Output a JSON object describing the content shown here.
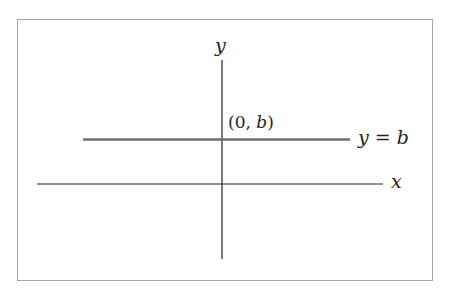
{
  "diagram": {
    "type": "coordinate-plane",
    "labels": {
      "y_axis": "y",
      "x_axis": "x",
      "point_open": "(0,",
      "point_var": "b",
      "point_close": ")",
      "line_lhs": "y",
      "line_eq": "=",
      "line_rhs": "b"
    },
    "elements": [
      {
        "kind": "axis",
        "name": "x-axis",
        "label": "x"
      },
      {
        "kind": "axis",
        "name": "y-axis",
        "label": "y"
      },
      {
        "kind": "horizontal-line",
        "equation": "y = b"
      },
      {
        "kind": "point",
        "label": "(0, b)"
      }
    ],
    "colors": {
      "axis": "#222222",
      "line": "#6e6e6e",
      "frame": "#a6a6a6",
      "background": "#ffffff"
    }
  }
}
